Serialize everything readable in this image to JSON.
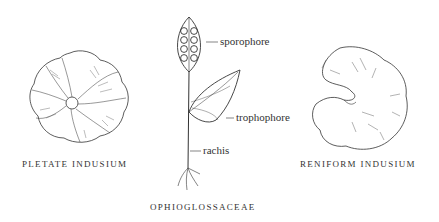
{
  "figures": [
    {
      "id": "pletate",
      "caption": "PLETATE INDUSIUM"
    },
    {
      "id": "ophioglossaceae",
      "caption": "OPHIOGLOSSACEAE",
      "labels": {
        "sporophore": "sporophore",
        "trophophore": "trophophore",
        "rachis": "rachis"
      }
    },
    {
      "id": "reniform",
      "caption": "RENIFORM INDUSIUM"
    }
  ]
}
